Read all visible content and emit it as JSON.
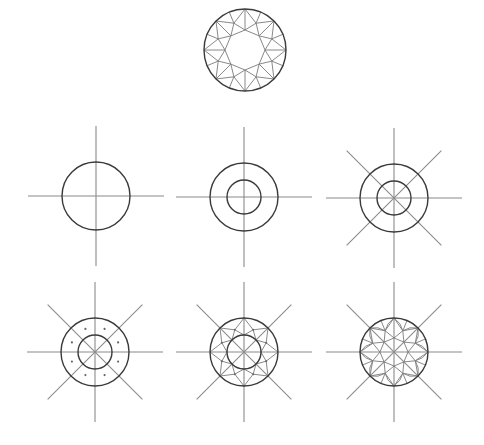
{
  "colors": {
    "background": "#ffffff",
    "outline": "#3a3a3a",
    "guide_lines": "#8a8a8a",
    "facet_lines": "#7a7a7a"
  },
  "final_diagram": {
    "label": "Finished brilliant cut (top view)",
    "center": [
      245,
      50
    ],
    "radius": 41
  },
  "steps": [
    {
      "step": 1,
      "label": "Circle with horizontal and vertical guide lines",
      "center": [
        96,
        196
      ]
    },
    {
      "step": 2,
      "label": "Add inner circle",
      "center": [
        244,
        197
      ]
    },
    {
      "step": 3,
      "label": "Add diagonal guide lines",
      "center": [
        394,
        198
      ]
    },
    {
      "step": 4,
      "label": "Mark 8 points between the guide lines",
      "center": [
        95,
        352
      ]
    },
    {
      "step": 5,
      "label": "Connect points to form the star facets",
      "center": [
        244,
        352
      ]
    },
    {
      "step": 6,
      "label": "Add remaining facet lines",
      "center": [
        394,
        352
      ]
    }
  ]
}
